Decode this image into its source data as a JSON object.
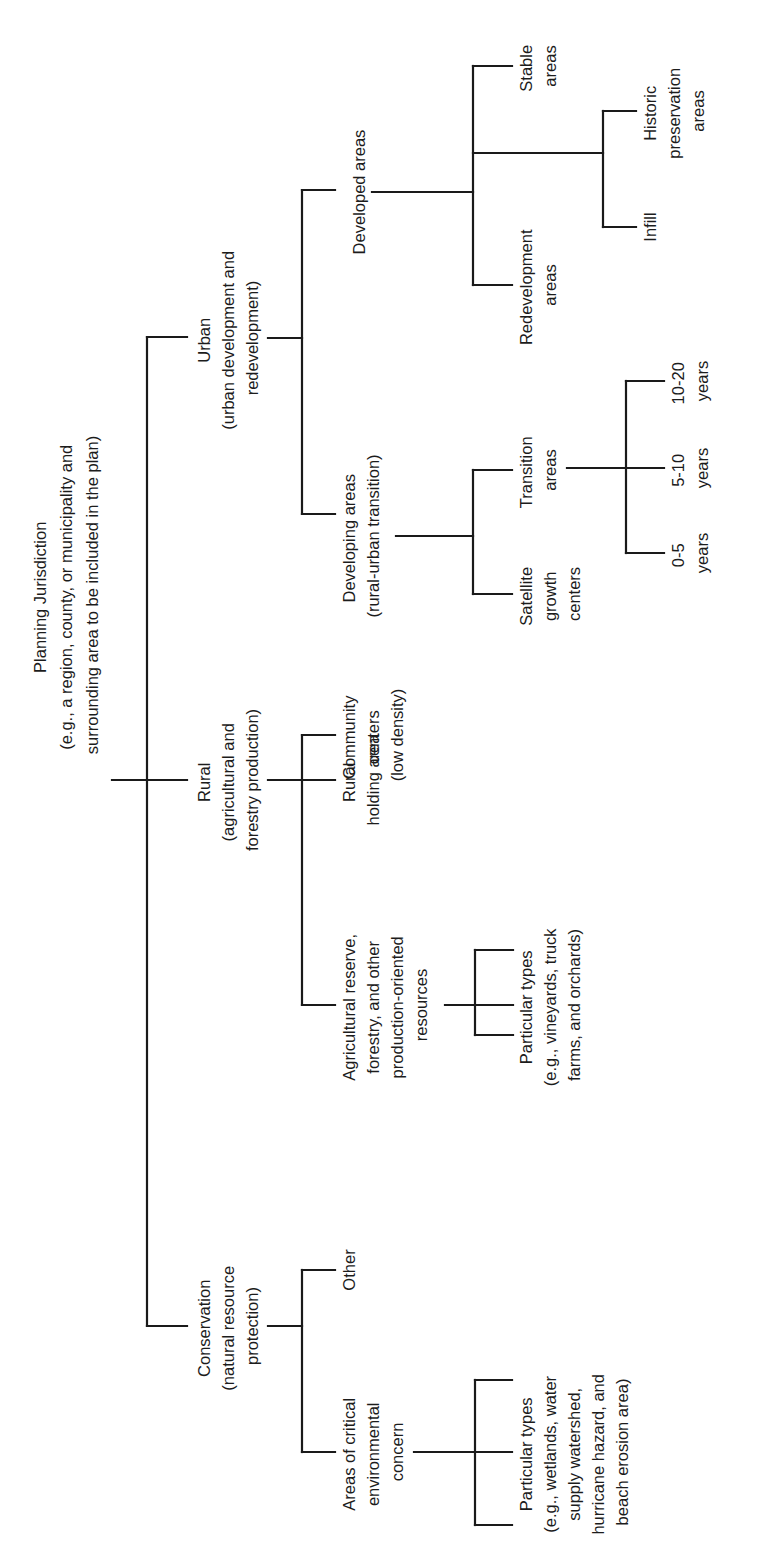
{
  "diagram": {
    "orientation": "rotated-90-counterclockwise",
    "line_color": "#1a1a1a",
    "root": {
      "lines": [
        "Planning Jurisdiction",
        "(e.g., a region, county, or municipality and",
        "surrounding area to be included in the plan)"
      ]
    },
    "conservation": {
      "lines": [
        "Conservation",
        "(natural resource",
        "protection)"
      ],
      "children": {
        "critical": {
          "lines": [
            "Areas of critical",
            "environmental",
            "concern"
          ]
        },
        "critical_types": {
          "lines": [
            "Particular types",
            "(e.g., wetlands, water",
            "supply watershed,",
            "hurricane hazard, and",
            "beach erosion area)"
          ]
        },
        "other": {
          "lines": [
            "Other"
          ]
        }
      }
    },
    "rural": {
      "lines": [
        "Rural",
        "(agricultural and",
        "forestry production)"
      ],
      "children": {
        "agricultural": {
          "lines": [
            "Agricultural reserve,",
            "forestry, and other",
            "production-oriented",
            "resources"
          ]
        },
        "agricultural_types": {
          "lines": [
            "Particular types",
            "(e.g., vineyards, truck",
            "farms, and orchards)"
          ]
        },
        "holding": {
          "lines": [
            "Rural",
            "holding area"
          ]
        },
        "community": {
          "lines": [
            "Community",
            "centers",
            "(low density)"
          ]
        }
      }
    },
    "urban": {
      "lines": [
        "Urban",
        "(urban development and",
        "redevelopment)"
      ],
      "children": {
        "developing": {
          "lines": [
            "Developing areas",
            "(rural-urban transition)"
          ]
        },
        "satellite": {
          "lines": [
            "Satellite",
            "growth",
            "centers"
          ]
        },
        "transition": {
          "lines": [
            "Transition",
            "areas"
          ]
        },
        "years_0_5": {
          "lines": [
            "0-5",
            "years"
          ]
        },
        "years_5_10": {
          "lines": [
            "5-10",
            "years"
          ]
        },
        "years_10_20": {
          "lines": [
            "10-20",
            "years"
          ]
        },
        "developed": {
          "lines": [
            "Developed areas"
          ]
        },
        "redevelopment": {
          "lines": [
            "Redevelopment",
            "areas"
          ]
        },
        "infill": {
          "lines": [
            "Infill"
          ]
        },
        "historic": {
          "lines": [
            "Historic",
            "preservation",
            "areas"
          ]
        },
        "stable": {
          "lines": [
            "Stable",
            "areas"
          ]
        }
      }
    }
  }
}
